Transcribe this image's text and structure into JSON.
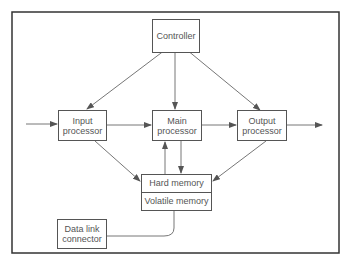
{
  "diagram": {
    "nodes": {
      "controller": "Controller",
      "input_processor": "Input processor",
      "main_processor": "Main processor",
      "output_processor": "Output processor",
      "hard_memory": "Hard memory",
      "volatile_memory": "Volatile memory",
      "data_link_connector": "Data link connector"
    },
    "edges": [
      {
        "from": "external",
        "to": "input_processor"
      },
      {
        "from": "controller",
        "to": "input_processor"
      },
      {
        "from": "controller",
        "to": "main_processor"
      },
      {
        "from": "controller",
        "to": "output_processor"
      },
      {
        "from": "input_processor",
        "to": "main_processor"
      },
      {
        "from": "main_processor",
        "to": "output_processor"
      },
      {
        "from": "output_processor",
        "to": "external"
      },
      {
        "from": "input_processor",
        "to": "memory"
      },
      {
        "from": "output_processor",
        "to": "memory"
      },
      {
        "from": "main_processor",
        "to": "memory"
      },
      {
        "from": "memory",
        "to": "main_processor"
      },
      {
        "from": "memory",
        "to": "data_link_connector",
        "style": "line"
      }
    ],
    "colors": {
      "line": "#555555",
      "background": "#ffffff"
    }
  }
}
